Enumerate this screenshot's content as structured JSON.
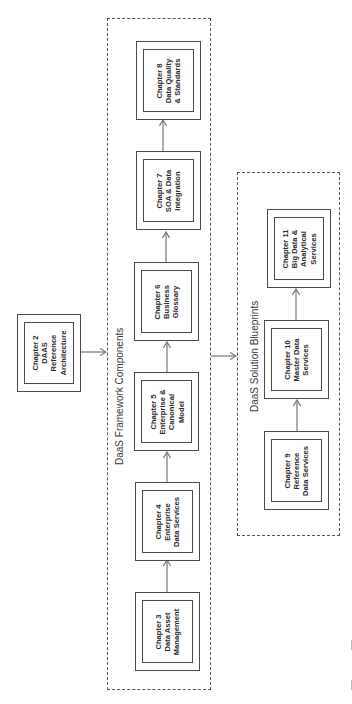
{
  "diagram": {
    "orientation": "rotated 90 degrees counter-clockwise",
    "source_box": {
      "id": "ch2",
      "lines": [
        "Chapter 2",
        "DAAS",
        "Reference",
        "Architecture"
      ]
    },
    "framework_group": {
      "title": "DaaS Framework Components",
      "boxes": [
        {
          "id": "ch3",
          "lines": [
            "Chapter 3",
            "Data Asset",
            "Management"
          ]
        },
        {
          "id": "ch4",
          "lines": [
            "Chapter 4",
            "Enterprise",
            "Data Services"
          ]
        },
        {
          "id": "ch5",
          "lines": [
            "Chapter 5",
            "Enterprise &",
            "Canonical",
            "Model"
          ]
        },
        {
          "id": "ch6",
          "lines": [
            "Chapter 6",
            "Business",
            "Glossary"
          ]
        },
        {
          "id": "ch7",
          "lines": [
            "Chapter 7",
            "SOA & Data",
            "Integration"
          ]
        },
        {
          "id": "ch8",
          "lines": [
            "Chapter 8",
            "Data Quality",
            "& Standards"
          ]
        }
      ]
    },
    "blueprint_group": {
      "title": "DaaS Solution Blueprints",
      "boxes": [
        {
          "id": "ch9",
          "lines": [
            "Chapter 9",
            "Reference",
            "Data Services"
          ]
        },
        {
          "id": "ch10",
          "lines": [
            "Chapter 10",
            "Master Data",
            "Services"
          ]
        },
        {
          "id": "ch11",
          "lines": [
            "Chapter 11",
            "Big Data &",
            "Analytical",
            "Services"
          ]
        }
      ]
    },
    "edges": [
      {
        "from": "ch2",
        "to": "framework_group"
      },
      {
        "from": "ch3",
        "to": "ch4"
      },
      {
        "from": "ch4",
        "to": "ch5"
      },
      {
        "from": "ch5",
        "to": "ch6"
      },
      {
        "from": "ch6",
        "to": "ch7"
      },
      {
        "from": "ch7",
        "to": "ch8"
      },
      {
        "from": "framework_group",
        "to": "blueprint_group"
      },
      {
        "from": "ch9",
        "to": "ch10"
      },
      {
        "from": "ch10",
        "to": "ch11"
      }
    ],
    "colors": {
      "line": "#4a4a4a",
      "arrow": "#777777",
      "background": "#ffffff"
    }
  }
}
